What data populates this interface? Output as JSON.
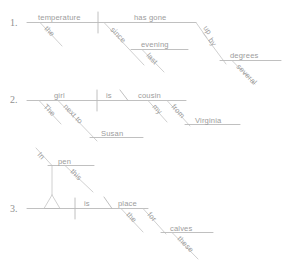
{
  "page": {
    "background_color": "#ffffff",
    "line_color": "#b9b9b9",
    "text_color": "#9c9c9c"
  },
  "exercises": [
    {
      "number": "1.",
      "sentence": "The temperature has gone up by several degrees since last evening.",
      "words": {
        "subject": "temperature",
        "subject_modifier": "the",
        "verb": "has gone",
        "adverb_up": "up",
        "prep_by": "by",
        "object_degrees": "degrees",
        "modifier_several": "several",
        "prep_since": "since",
        "object_evening": "evening",
        "modifier_last": "last"
      }
    },
    {
      "number": "2.",
      "sentence": "The girl next to Susan is my cousin from Virginia.",
      "words": {
        "subject": "girl",
        "subject_modifier": "The",
        "prep_next_to": "next to",
        "object_susan": "Susan",
        "verb": "is",
        "complement": "cousin",
        "complement_modifier": "my",
        "prep_from": "from",
        "object_virginia": "Virginia"
      }
    },
    {
      "number": "3.",
      "sentence": "In this pen is the place for these calves.",
      "words": {
        "prep_in": "In",
        "object_pen": "pen",
        "object_modifier": "this",
        "verb": "is",
        "complement": "place",
        "complement_modifier": "the",
        "prep_for": "for",
        "object_calves": "calves",
        "object_calves_modifier": "these"
      }
    }
  ]
}
